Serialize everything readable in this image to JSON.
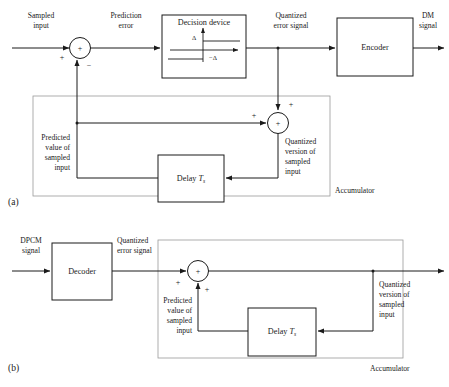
{
  "figure": {
    "panels": [
      {
        "tag": "(a)",
        "name": "transmitter"
      },
      {
        "tag": "(b)",
        "name": "receiver"
      }
    ]
  },
  "panel_a": {
    "tag": "(a)",
    "blocks": [
      {
        "id": "decision-device",
        "label": "Decision device"
      },
      {
        "id": "encoder",
        "label": "Encoder"
      },
      {
        "id": "delay",
        "label": "Delay",
        "param": "T",
        "param_sub": "s"
      }
    ],
    "signals": {
      "sampled_input": "Sampled\ninput",
      "sampled_input_l1": "Sampled",
      "sampled_input_l2": "input",
      "prediction_error": "Prediction\nerror",
      "prediction_error_l1": "Prediction",
      "prediction_error_l2": "error",
      "quantized_error": "Quantized\nerror signal",
      "quantized_error_l1": "Quantized",
      "quantized_error_l2": "error signal",
      "dm_signal_l1": "DM",
      "dm_signal_l2": "signal",
      "predicted_value_l1": "Predicted",
      "predicted_value_l2": "value of",
      "predicted_value_l3": "sampled",
      "predicted_value_l4": "input",
      "quantized_version_l1": "Quantized",
      "quantized_version_l2": "version of",
      "quantized_version_l3": "sampled",
      "quantized_version_l4": "input"
    },
    "quantizer": {
      "positive_level": "Δ",
      "negative_level": "−Δ"
    },
    "summers": {
      "first": {
        "center": "+",
        "in_left": "+",
        "in_feedback": "−"
      },
      "second": {
        "center": "+",
        "in_left": "+",
        "in_top": "+"
      }
    },
    "accumulator_label": "Accumulator"
  },
  "panel_b": {
    "tag": "(b)",
    "blocks": [
      {
        "id": "decoder",
        "label": "Decoder"
      },
      {
        "id": "delay",
        "label": "Delay",
        "param": "T",
        "param_sub": "s"
      }
    ],
    "signals": {
      "dpcm_signal_l1": "DPCM",
      "dpcm_signal_l2": "signal",
      "quantized_error_l1": "Quantized",
      "quantized_error_l2": "error signal",
      "predicted_value_l1": "Predicted",
      "predicted_value_l2": "value of",
      "predicted_value_l3": "sampled",
      "predicted_value_l4": "input",
      "quantized_version_l1": "Quantized",
      "quantized_version_l2": "version of",
      "quantized_version_l3": "sampled",
      "quantized_version_l4": "input"
    },
    "summers": {
      "main": {
        "center": "+",
        "in_left": "+",
        "in_bottom": "+"
      }
    },
    "accumulator_label": "Accumulator"
  },
  "colors": {
    "ink": "#1a1a1a",
    "dashed_border": "#9a9a9a",
    "paper": "#ffffff"
  }
}
